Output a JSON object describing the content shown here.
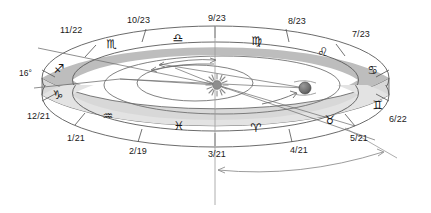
{
  "diagram": {
    "colors": {
      "ring_far_band": "#bdbdbd",
      "ring_near_band": "#e3e3e3",
      "ring_side_wall": "#d2d2d2",
      "outline": "#5a5a5a",
      "sun": "#8c8c8c",
      "earth": "#6e6e6e",
      "text": "#1a1a1a",
      "background": "#ffffff"
    },
    "tilt_label": "16°"
  },
  "zodiac": {
    "signs": [
      {
        "name": "sagittarius",
        "glyph": "♐",
        "boundary_date": "11/22",
        "x": 59,
        "y": 69
      },
      {
        "name": "scorpio",
        "glyph": "♏",
        "boundary_date": "10/23",
        "x": 112,
        "y": 44
      },
      {
        "name": "libra",
        "glyph": "♎",
        "boundary_date": "9/23",
        "x": 178,
        "y": 38
      },
      {
        "name": "virgo",
        "glyph": "♍",
        "boundary_date": "8/23",
        "x": 257,
        "y": 41
      },
      {
        "name": "leo",
        "glyph": "♌",
        "boundary_date": "7/23",
        "x": 323,
        "y": 52
      },
      {
        "name": "cancer",
        "glyph": "♋",
        "boundary_date": "6/22",
        "x": 373,
        "y": 70
      },
      {
        "name": "gemini",
        "glyph": "♊",
        "boundary_date": "5/21",
        "x": 378,
        "y": 105
      },
      {
        "name": "taurus",
        "glyph": "♉",
        "boundary_date": "4/21",
        "x": 330,
        "y": 120
      },
      {
        "name": "aries",
        "glyph": "♈",
        "boundary_date": "3/21",
        "x": 256,
        "y": 128
      },
      {
        "name": "pisces",
        "glyph": "♓",
        "boundary_date": "2/19",
        "x": 179,
        "y": 126
      },
      {
        "name": "aquarius",
        "glyph": "♒",
        "boundary_date": "1/21",
        "x": 108,
        "y": 116
      },
      {
        "name": "capricorn",
        "glyph": "♑",
        "boundary_date": "12/21",
        "x": 58,
        "y": 95
      }
    ],
    "date_labels": [
      {
        "text": "11/22",
        "x": 60,
        "y": 25
      },
      {
        "text": "10/23",
        "x": 127,
        "y": 15
      },
      {
        "text": "9/23",
        "x": 208,
        "y": 13
      },
      {
        "text": "8/23",
        "x": 288,
        "y": 16
      },
      {
        "text": "7/23",
        "x": 352,
        "y": 29
      },
      {
        "text": "6/22",
        "x": 389,
        "y": 114
      },
      {
        "text": "5/21",
        "x": 350,
        "y": 133
      },
      {
        "text": "4/21",
        "x": 290,
        "y": 145
      },
      {
        "text": "3/21",
        "x": 208,
        "y": 149
      },
      {
        "text": "2/19",
        "x": 129,
        "y": 146
      },
      {
        "text": "1/21",
        "x": 67,
        "y": 133
      },
      {
        "text": "12/21",
        "x": 27,
        "y": 111
      }
    ],
    "annotations": [
      {
        "name": "tilt-angle",
        "text": "16°",
        "x": 19,
        "y": 68
      }
    ]
  },
  "bodies": {
    "sun": {
      "label": "sun",
      "cx": 217,
      "cy": 85,
      "r": 5.5
    },
    "earth": {
      "label": "earth",
      "cx": 305,
      "cy": 88,
      "r": 6.0
    }
  }
}
